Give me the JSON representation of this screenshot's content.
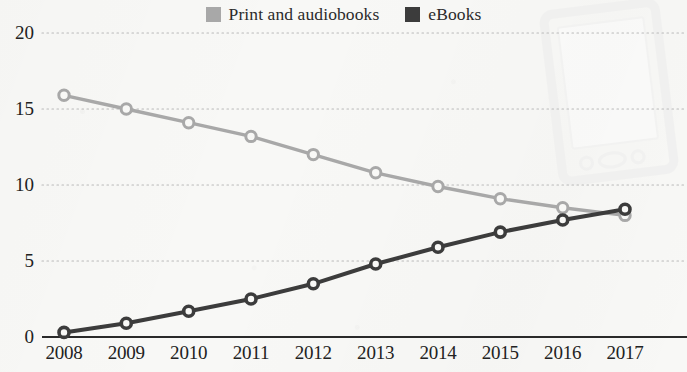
{
  "legend": {
    "position": "top-center",
    "entries": [
      {
        "label": "Print and audiobooks",
        "color": "#a8a8a8",
        "icon": "legend-swatch-print"
      },
      {
        "label": "eBooks",
        "color": "#3c3c3c",
        "icon": "legend-swatch-ebooks"
      }
    ]
  },
  "watermark": {
    "name": "tablet-ereader-watermark",
    "color": "#efefef"
  },
  "axes": {
    "y_ticks": [
      "0",
      "5",
      "10",
      "15",
      "20"
    ],
    "x_ticks": [
      "2008",
      "2009",
      "2010",
      "2011",
      "2012",
      "2013",
      "2014",
      "2015",
      "2016",
      "2017"
    ]
  },
  "chart_data": {
    "type": "line",
    "title": "",
    "subtitle": "",
    "xlabel": "",
    "ylabel": "",
    "grid": true,
    "legend_position": "top-center",
    "x": [
      2008,
      2009,
      2010,
      2011,
      2012,
      2013,
      2014,
      2015,
      2016,
      2017
    ],
    "categories": [
      "2008",
      "2009",
      "2010",
      "2011",
      "2012",
      "2013",
      "2014",
      "2015",
      "2016",
      "2017"
    ],
    "xlim": [
      2008,
      2017
    ],
    "ylim": [
      0,
      20
    ],
    "yticks": [
      0,
      5,
      10,
      15,
      20
    ],
    "series": [
      {
        "name": "Print and audiobooks",
        "color": "#a8a8a8",
        "marker": "circle-open",
        "values": [
          15.9,
          15.0,
          14.1,
          13.2,
          12.0,
          10.8,
          9.9,
          9.1,
          8.5,
          8.0
        ]
      },
      {
        "name": "eBooks",
        "color": "#3c3c3c",
        "marker": "circle-open",
        "values": [
          0.3,
          0.9,
          1.7,
          2.5,
          3.5,
          4.8,
          5.9,
          6.9,
          7.7,
          8.4
        ]
      }
    ]
  }
}
